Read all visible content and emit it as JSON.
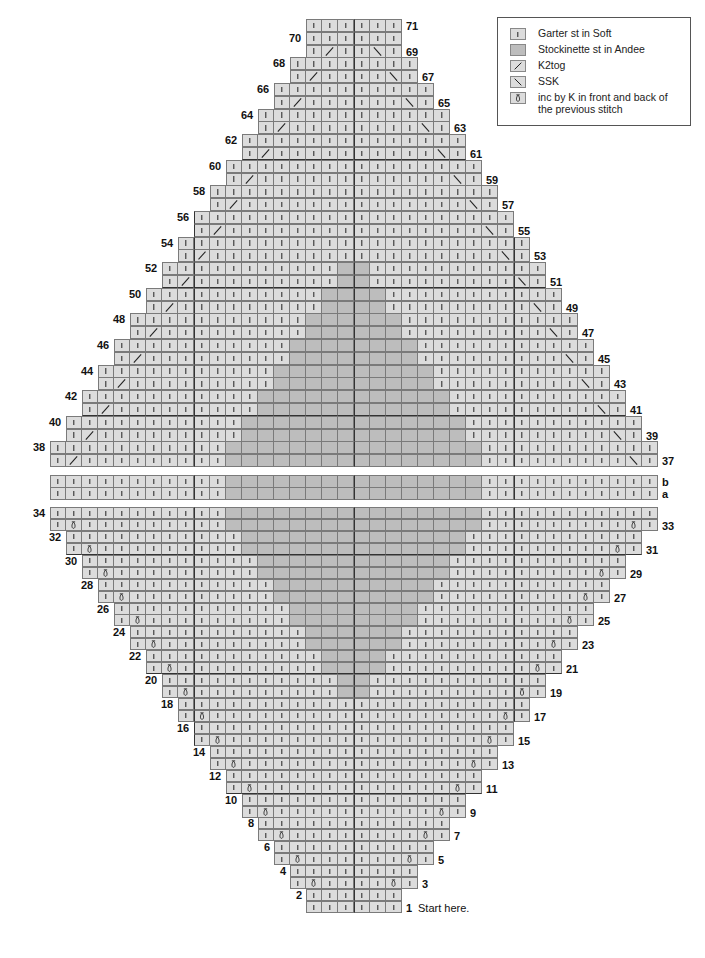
{
  "legend": {
    "items": [
      {
        "symbol": "garter",
        "icon": "vertical-bar-icon",
        "label": "Garter st in Soft"
      },
      {
        "symbol": "stockinette",
        "icon": "filled-square-icon",
        "label": "Stockinette st in Andee"
      },
      {
        "symbol": "k2tog",
        "icon": "forward-slash-icon",
        "label": "K2tog"
      },
      {
        "symbol": "ssk",
        "icon": "backslash-icon",
        "label": "SSK"
      },
      {
        "symbol": "inc",
        "icon": "loop-increase-icon",
        "label": "inc by K in front and back of the previous stitch"
      }
    ]
  },
  "colors": {
    "garter": "#dcdcdc",
    "stockinette": "#bdbdbd",
    "grid": "#7a7a7a",
    "thick_grid": "#333333"
  },
  "chart": {
    "total_columns": 38,
    "center_column_boundary": 19,
    "start_note": "Start here.",
    "lower_section": {
      "rows": "1-34",
      "row_1_2_columns": [
        16,
        21
      ],
      "widening": "each odd row from 3 increases by 1 stitch on each side",
      "increase_rows": [
        3,
        5,
        7,
        9,
        11,
        13,
        15,
        17,
        19,
        21,
        23,
        25,
        27,
        29,
        31,
        33
      ],
      "stockinette_rows": "19-34",
      "stockinette_rows_33_34_columns": [
        11,
        26
      ],
      "stockinette_narrowing": "1 stitch each side every 2 rows going down to rows 19-20 (cols 18-19)"
    },
    "middle_section": {
      "rows": [
        "b",
        "a"
      ],
      "columns": [
        0,
        37
      ],
      "stockinette_columns": [
        11,
        26
      ]
    },
    "upper_section": {
      "rows": "37-71",
      "row_37_38_columns": [
        0,
        37
      ],
      "decrease_rows": [
        37,
        39,
        41,
        43,
        45,
        47,
        49,
        51,
        53,
        55,
        57,
        59,
        61,
        63,
        65,
        67,
        69
      ],
      "stockinette_rows": "37-52",
      "stockinette_rows_37_38_columns": [
        11,
        26
      ],
      "top_rows_69_71_columns": [
        16,
        21
      ]
    },
    "left_labels": [
      2,
      4,
      6,
      8,
      10,
      12,
      14,
      16,
      18,
      20,
      22,
      24,
      26,
      28,
      30,
      32,
      34,
      38,
      40,
      42,
      44,
      46,
      48,
      50,
      52,
      54,
      56,
      58,
      60,
      62,
      64,
      66,
      68,
      70
    ],
    "right_labels": [
      1,
      3,
      5,
      7,
      9,
      11,
      13,
      15,
      17,
      19,
      21,
      23,
      25,
      27,
      29,
      31,
      33,
      37,
      39,
      41,
      43,
      45,
      47,
      49,
      51,
      53,
      55,
      57,
      59,
      61,
      63,
      65,
      67,
      69,
      71
    ],
    "middle_labels": [
      "b",
      "a"
    ]
  }
}
